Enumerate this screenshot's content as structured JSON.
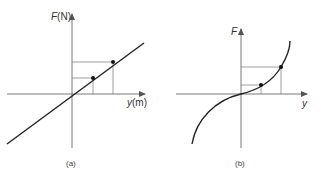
{
  "panels": [
    {
      "id": "a",
      "caption": "(a)",
      "y_axis_label_italic": "F",
      "y_axis_label_unit": "(N)",
      "x_axis_label_italic": "y",
      "x_axis_label_unit": "(m)",
      "curve": "linear",
      "marked_points": 2
    },
    {
      "id": "b",
      "caption": "(b)",
      "y_axis_label_italic": "F",
      "y_axis_label_unit": "",
      "x_axis_label_italic": "y",
      "x_axis_label_unit": "",
      "curve": "nonlinear (stiffening, cubic-like)",
      "marked_points": 2
    }
  ],
  "colors": {
    "line": "#222222",
    "axis": "#555555",
    "guide": "#777777",
    "background": "#ffffff"
  }
}
